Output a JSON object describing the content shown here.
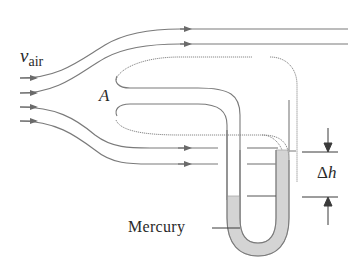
{
  "diagram": {
    "labels": {
      "velocity_symbol": "v",
      "velocity_subscript": "air",
      "point_label": "A",
      "fluid_label": "Mercury",
      "delta_symbol": "Δ",
      "height_symbol": "h"
    },
    "colors": {
      "line": "#7a7a7a",
      "arrow": "#6a6a6a",
      "mercury_fill": "#d4d4d4",
      "mercury_edge": "#a8a8a8",
      "text": "#2a2a2a",
      "dimension_line": "#3a3a3a"
    },
    "elements": {
      "incoming_streamlines": 4,
      "outgoing_top_streamlines": 2,
      "outgoing_lower_streamlines": 2,
      "manometer": "U-tube",
      "dimension": "Δh between mercury levels"
    }
  }
}
